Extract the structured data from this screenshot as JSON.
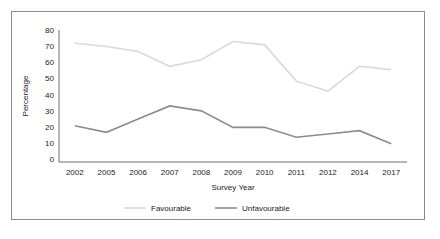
{
  "chart_data": {
    "type": "line",
    "title": "",
    "xlabel": "Survey Year",
    "ylabel": "Percentage",
    "categories": [
      "2002",
      "2005",
      "2006",
      "2007",
      "2008",
      "2009",
      "2010",
      "2011",
      "2012",
      "2014",
      "2017"
    ],
    "x": [
      2002,
      2005,
      2006,
      2007,
      2008,
      2009,
      2010,
      2011,
      2012,
      2014,
      2017
    ],
    "series": [
      {
        "name": "Favourable",
        "color": "#d9d9d9",
        "values": [
          72,
          70,
          67,
          58,
          62,
          73,
          71,
          49,
          43,
          58,
          56
        ]
      },
      {
        "name": "Unfavourable",
        "color": "#8c8c8c",
        "values": [
          22,
          18,
          26,
          34,
          31,
          21,
          21,
          15,
          17,
          19,
          11
        ]
      }
    ],
    "ylim": [
      0,
      80
    ],
    "yticks": [
      0,
      10,
      20,
      30,
      40,
      50,
      60,
      70,
      80
    ],
    "ytick_labels": [
      "0",
      "10",
      "20",
      "30",
      "40",
      "50",
      "60",
      "70",
      "80"
    ],
    "grid": false,
    "legend_position": "bottom",
    "legend_entries": [
      "Favourable",
      "Unfavourable"
    ]
  },
  "frame": {
    "border_color": "#8a8a8a",
    "background": "#ffffff"
  }
}
